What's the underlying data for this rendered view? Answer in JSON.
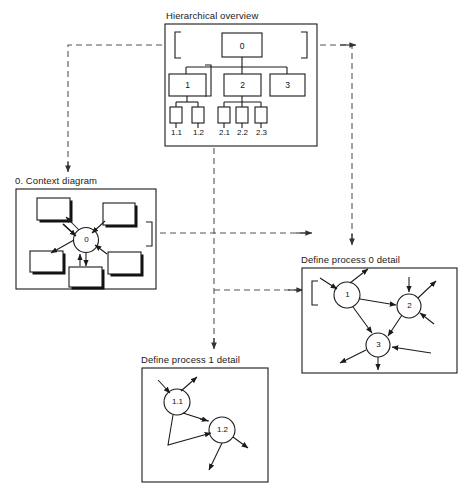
{
  "diagram": {
    "title_hierarchical": "Hierarchical overview",
    "title_context": "0. Context diagram",
    "title_process0": "Define process 0 detail",
    "title_process1": "Define process 1 detail",
    "colors": {
      "stroke": "#1a1a1a",
      "dashed": "#555555",
      "background": "#ffffff",
      "shadow": "#111111"
    }
  },
  "hierarchical_overview": {
    "root": {
      "label": "0"
    },
    "level1": [
      {
        "label": "1"
      },
      {
        "label": "2"
      },
      {
        "label": "3"
      }
    ],
    "level2": [
      {
        "label": "1.1",
        "parent": "1"
      },
      {
        "label": "1.2",
        "parent": "1"
      },
      {
        "label": "2.1",
        "parent": "2"
      },
      {
        "label": "2.2",
        "parent": "2"
      },
      {
        "label": "2.3",
        "parent": "2"
      }
    ]
  },
  "context_diagram": {
    "process": {
      "label": "0"
    },
    "external_entities": [
      {
        "id": "e1"
      },
      {
        "id": "e2"
      },
      {
        "id": "e3"
      },
      {
        "id": "e4"
      },
      {
        "id": "e5"
      },
      {
        "id": "e6"
      }
    ]
  },
  "process0_detail": {
    "processes": [
      {
        "label": "1"
      },
      {
        "label": "2"
      },
      {
        "label": "3"
      }
    ]
  },
  "process1_detail": {
    "processes": [
      {
        "label": "1.1"
      },
      {
        "label": "1.2"
      }
    ]
  }
}
